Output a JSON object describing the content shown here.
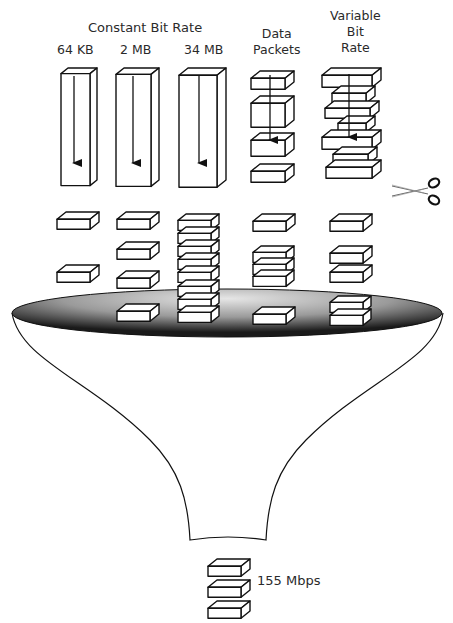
{
  "title": "Constant Bit Rate",
  "columns": [
    {
      "id": "64kb",
      "label": "64 KB",
      "type": "cbr"
    },
    {
      "id": "2mb",
      "label": "2 MB",
      "type": "cbr"
    },
    {
      "id": "34mb",
      "label": "34 MB",
      "type": "cbr"
    },
    {
      "id": "data",
      "label_lines": [
        "Data",
        "Packets"
      ],
      "type": "packets"
    },
    {
      "id": "vbr",
      "label_lines": [
        "Variable",
        "Bit",
        "Rate"
      ],
      "type": "vbr"
    }
  ],
  "output": {
    "label": "155 Mbps",
    "packet_count": 3
  },
  "icons": {
    "scissors": "scissors-icon",
    "funnel": "funnel-shape"
  },
  "colors": {
    "stroke": "#111111",
    "fill": "#ffffff",
    "funnel_dark": "#1a1a1a",
    "funnel_light": "#d9d9d9"
  },
  "geometry": {
    "cbr_bars": [
      {
        "x": 61,
        "y": 68,
        "w": 29,
        "h": 112,
        "d": 7
      },
      {
        "x": 116,
        "y": 68,
        "w": 35,
        "h": 112,
        "d": 8
      },
      {
        "x": 179,
        "y": 68,
        "w": 38,
        "h": 112,
        "d": 9
      }
    ],
    "data_packets_top": [
      {
        "x": 251,
        "y": 71,
        "w": 34,
        "h": 11,
        "d": 9
      },
      {
        "x": 251,
        "y": 96,
        "w": 34,
        "h": 24,
        "d": 9
      },
      {
        "x": 251,
        "y": 133,
        "w": 34,
        "h": 16,
        "d": 9
      },
      {
        "x": 251,
        "y": 164,
        "w": 34,
        "h": 11,
        "d": 9
      }
    ],
    "vbr_top": [
      {
        "x": 322,
        "y": 68,
        "w": 50,
        "h": 12,
        "d": 9
      },
      {
        "x": 332,
        "y": 86,
        "w": 34,
        "h": 10,
        "d": 9
      },
      {
        "x": 325,
        "y": 101,
        "w": 45,
        "h": 10,
        "d": 9
      },
      {
        "x": 338,
        "y": 116,
        "w": 28,
        "h": 9,
        "d": 9
      },
      {
        "x": 322,
        "y": 130,
        "w": 50,
        "h": 12,
        "d": 9
      },
      {
        "x": 333,
        "y": 147,
        "w": 35,
        "h": 10,
        "d": 9
      },
      {
        "x": 326,
        "y": 160,
        "w": 46,
        "h": 11,
        "d": 9
      }
    ],
    "packets_below": [
      {
        "x": 57,
        "y": 212,
        "w": 33,
        "h": 10,
        "d": 9
      },
      {
        "x": 57,
        "y": 265,
        "w": 33,
        "h": 10,
        "d": 9
      },
      {
        "x": 117,
        "y": 212,
        "w": 33,
        "h": 10,
        "d": 9
      },
      {
        "x": 117,
        "y": 242,
        "w": 33,
        "h": 10,
        "d": 9
      },
      {
        "x": 117,
        "y": 271,
        "w": 33,
        "h": 10,
        "d": 9
      },
      {
        "x": 117,
        "y": 304,
        "w": 33,
        "h": 10,
        "d": 9
      },
      {
        "x": 178,
        "y": 214,
        "w": 33,
        "h": 10,
        "d": 8
      },
      {
        "x": 178,
        "y": 227,
        "w": 33,
        "h": 10,
        "d": 8
      },
      {
        "x": 178,
        "y": 240,
        "w": 33,
        "h": 10,
        "d": 8
      },
      {
        "x": 178,
        "y": 253,
        "w": 33,
        "h": 10,
        "d": 8
      },
      {
        "x": 178,
        "y": 266,
        "w": 33,
        "h": 10,
        "d": 8
      },
      {
        "x": 178,
        "y": 280,
        "w": 33,
        "h": 10,
        "d": 8
      },
      {
        "x": 178,
        "y": 293,
        "w": 33,
        "h": 10,
        "d": 8
      },
      {
        "x": 178,
        "y": 306,
        "w": 33,
        "h": 10,
        "d": 8
      },
      {
        "x": 253,
        "y": 214,
        "w": 33,
        "h": 10,
        "d": 9
      },
      {
        "x": 253,
        "y": 246,
        "w": 33,
        "h": 10,
        "d": 8
      },
      {
        "x": 253,
        "y": 258,
        "w": 33,
        "h": 10,
        "d": 8
      },
      {
        "x": 253,
        "y": 270,
        "w": 33,
        "h": 10,
        "d": 8
      },
      {
        "x": 253,
        "y": 307,
        "w": 33,
        "h": 10,
        "d": 9
      },
      {
        "x": 330,
        "y": 214,
        "w": 33,
        "h": 10,
        "d": 9
      },
      {
        "x": 330,
        "y": 246,
        "w": 33,
        "h": 10,
        "d": 9
      },
      {
        "x": 330,
        "y": 265,
        "w": 33,
        "h": 10,
        "d": 9
      },
      {
        "x": 330,
        "y": 296,
        "w": 33,
        "h": 10,
        "d": 8
      },
      {
        "x": 330,
        "y": 309,
        "w": 33,
        "h": 10,
        "d": 8
      }
    ],
    "output_packets": [
      {
        "x": 208,
        "y": 559,
        "w": 33,
        "h": 10,
        "d": 9
      },
      {
        "x": 208,
        "y": 580,
        "w": 33,
        "h": 10,
        "d": 9
      },
      {
        "x": 208,
        "y": 601,
        "w": 33,
        "h": 10,
        "d": 9
      }
    ]
  }
}
